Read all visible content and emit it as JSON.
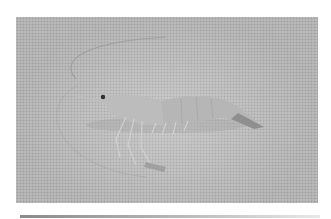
{
  "image": {
    "subject": "shrimp",
    "description": "Grayscale halftone photograph of a single shrimp lying on a textured surface, long antennae curving back around the body",
    "colors": {
      "background": "#ffffff",
      "surface": "#c9c9c9",
      "halftone_dot": "#9e9e9e",
      "shrimp_body": "#b8b8b8",
      "shrimp_shadow": "#8f8f8f",
      "antenna": "#9a9a9a",
      "eye": "#303030"
    }
  }
}
